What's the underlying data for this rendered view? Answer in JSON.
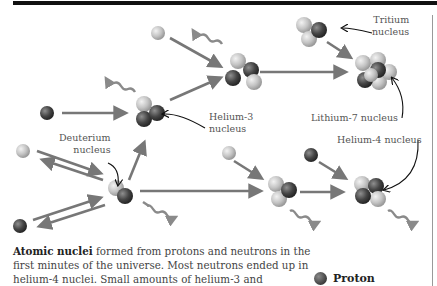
{
  "labels": {
    "tritium": [
      "Tritium",
      "nucleus"
    ],
    "helium3": [
      "Helium-3",
      "nucleus"
    ],
    "lithium7": "Lithium-7 nucleus",
    "helium4": "Helium-4 nucleus",
    "deuterium": [
      "Deuterium",
      "nucleus"
    ]
  },
  "caption": {
    "bold": "Atomic nuclei",
    "text": " formed from protons and neutrons in the first minutes of the universe. Most neutrons ended up in helium-4 nuclei. Small amounts of helium-3 and"
  },
  "legend": {
    "items": [
      {
        "label": "Proton",
        "color": "#3b3b3b"
      }
    ]
  },
  "colors": {
    "proton": "#3b3b3b",
    "neutron": "#c8c8c8",
    "arrow": "#777777",
    "top_bar": "#111111"
  }
}
